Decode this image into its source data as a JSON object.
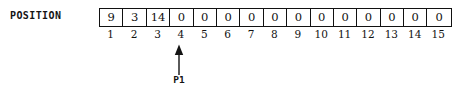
{
  "figure": {
    "array_label": "POSITION",
    "cells": [
      "9",
      "3",
      "14",
      "0",
      "0",
      "0",
      "0",
      "0",
      "0",
      "0",
      "0",
      "0",
      "0",
      "0",
      "0"
    ],
    "indices": [
      "1",
      "2",
      "3",
      "4",
      "5",
      "6",
      "7",
      "8",
      "9",
      "10",
      "11",
      "12",
      "13",
      "14",
      "15"
    ],
    "pointer": {
      "label": "P1",
      "points_to_index": "4",
      "icon": "up-arrow-icon"
    },
    "colors": {
      "background": "#ffffff",
      "border": "#111111",
      "text": "#101010"
    }
  }
}
